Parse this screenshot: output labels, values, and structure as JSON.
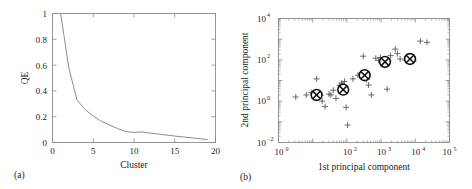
{
  "figure": {
    "panels": [
      {
        "tag": "(a)",
        "xlabel": "Cluster",
        "ylabel": "QE"
      },
      {
        "tag": "(b)",
        "xlabel": "1st principal component",
        "ylabel": "2nd principal component"
      }
    ]
  },
  "chart_data": [
    {
      "type": "line",
      "title": "",
      "panel": "(a)",
      "xlabel": "Cluster",
      "ylabel": "QE",
      "xlim": [
        0,
        20
      ],
      "ylim": [
        0,
        1
      ],
      "xticks": [
        0,
        5,
        10,
        15,
        20
      ],
      "xticklabels": [
        "0",
        "5",
        "10",
        "15",
        "20"
      ],
      "yticks": [
        0,
        0.2,
        0.4,
        0.6,
        0.8,
        1
      ],
      "yticklabels": [
        "0",
        "0.2",
        "0.4",
        "0.6",
        "0.8",
        "1"
      ],
      "grid": false,
      "legend": "none",
      "line_color": "#8c8c8c",
      "x": [
        1,
        2,
        3,
        4,
        5,
        6,
        7,
        8,
        9,
        10,
        11,
        12,
        13,
        14,
        15,
        16,
        17,
        18,
        19
      ],
      "values": [
        1.0,
        0.58,
        0.33,
        0.255,
        0.205,
        0.165,
        0.135,
        0.108,
        0.085,
        0.078,
        0.082,
        0.073,
        0.065,
        0.058,
        0.05,
        0.043,
        0.037,
        0.03,
        0.022
      ]
    },
    {
      "type": "scatter",
      "title": "",
      "panel": "(b)",
      "xlabel": "1st principal component",
      "ylabel": "2nd principal component",
      "xscale": "log",
      "yscale": "log",
      "xlim": [
        1,
        100000
      ],
      "ylim": [
        0.01,
        10000
      ],
      "xticks": [
        1,
        100,
        1000,
        10000,
        100000
      ],
      "xticklabels": [
        "10^0",
        "10^2",
        "10^3",
        "10^4",
        "10^5"
      ],
      "yticks": [
        0.01,
        1,
        100,
        10000
      ],
      "yticklabels": [
        "10^-2",
        "10^0",
        "10^2",
        "10^4"
      ],
      "grid": false,
      "legend": "none",
      "series": [
        {
          "name": "data points",
          "marker": "plus",
          "color": "#5a5a5a",
          "points": [
            [
              3.2,
              1.6
            ],
            [
              6.5,
              2.0
            ],
            [
              9.0,
              2.6
            ],
            [
              11.0,
              1.4
            ],
            [
              13.0,
              12.0
            ],
            [
              17.0,
              1.9
            ],
            [
              19.0,
              1.0
            ],
            [
              23.0,
              0.55
            ],
            [
              30.0,
              2.2
            ],
            [
              34.0,
              2.0
            ],
            [
              40.0,
              3.4
            ],
            [
              48.0,
              1.35
            ],
            [
              62.0,
              5.8
            ],
            [
              70.0,
              7.5
            ],
            [
              76.0,
              6.2
            ],
            [
              80.0,
              5.0
            ],
            [
              85.0,
              9.0
            ],
            [
              90.0,
              3.0
            ],
            [
              95.0,
              0.5
            ],
            [
              105.0,
              0.07
            ],
            [
              150.0,
              12.0
            ],
            [
              210.0,
              18.0
            ],
            [
              260.0,
              22.0
            ],
            [
              300.0,
              150.0
            ],
            [
              380.0,
              11.0
            ],
            [
              430.0,
              6.0
            ],
            [
              520.0,
              2.0
            ],
            [
              700.0,
              120.0
            ],
            [
              850.0,
              95.0
            ],
            [
              950.0,
              130.0
            ],
            [
              1100.0,
              75.0
            ],
            [
              1300.0,
              55.0
            ],
            [
              1500.0,
              3.8
            ],
            [
              1900.0,
              160.0
            ],
            [
              2600.0,
              330.0
            ],
            [
              3000.0,
              200.0
            ],
            [
              3600.0,
              110.0
            ],
            [
              5200.0,
              95.0
            ],
            [
              9000.0,
              85.0
            ],
            [
              14000.0,
              800.0
            ],
            [
              22000.0,
              700.0
            ]
          ]
        },
        {
          "name": "cluster centroids",
          "marker": "circle-cross",
          "color": "#111111",
          "points": [
            [
              13.0,
              2.0
            ],
            [
              78.0,
              3.6
            ],
            [
              330.0,
              18.0
            ],
            [
              1300.0,
              80.0
            ],
            [
              7000.0,
              110.0
            ]
          ]
        }
      ]
    }
  ]
}
